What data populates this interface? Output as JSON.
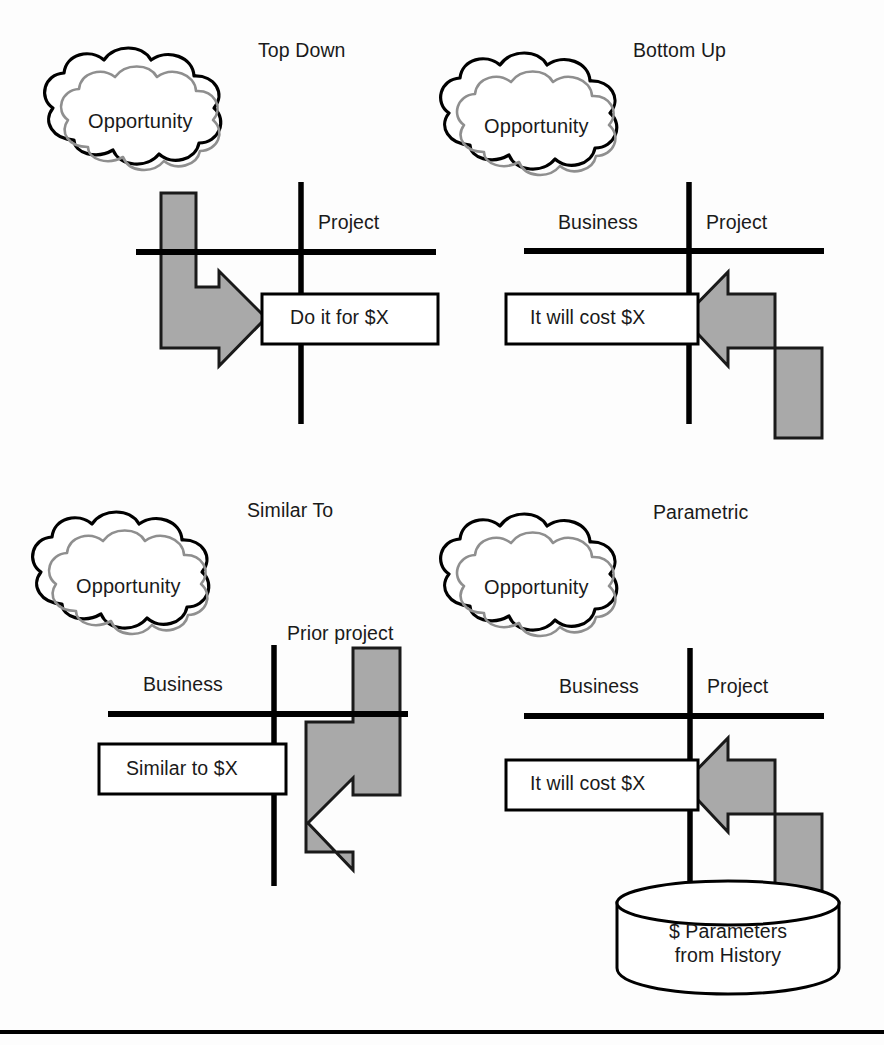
{
  "figure": {
    "bottom_rule": true,
    "colors": {
      "stroke": "#000000",
      "arrow_fill": "#a9a9a9",
      "arrow_stroke": "#1a1a1a",
      "cloud_inner_stroke": "#8c8c8c",
      "background": "#fdfdfd"
    }
  },
  "panels": [
    {
      "id": "top-down",
      "title": "Top Down",
      "cloud_label": "Opportunity",
      "axis_labels": {
        "left": "",
        "right": "Project"
      },
      "box_text": "Do it for $X",
      "arrow": {
        "name": "top-down-arrow",
        "direction": "down-then-right",
        "origin": "cloud",
        "target": "box"
      },
      "cylinder": null
    },
    {
      "id": "bottom-up",
      "title": "Bottom Up",
      "cloud_label": "Opportunity",
      "axis_labels": {
        "left": "Business",
        "right": "Project"
      },
      "box_text": "It will cost $X",
      "arrow": {
        "name": "bottom-up-arrow",
        "direction": "up-then-left",
        "origin": "project-bottom",
        "target": "box"
      },
      "cylinder": null
    },
    {
      "id": "similar-to",
      "title": "Similar To",
      "cloud_label": "Opportunity",
      "axis_labels": {
        "left": "Business",
        "right": "Prior project"
      },
      "box_text": "Similar to $X",
      "arrow": {
        "name": "similar-to-arrow",
        "direction": "down-then-left",
        "origin": "prior-project",
        "target": "box"
      },
      "cylinder": null
    },
    {
      "id": "parametric",
      "title": "Parametric",
      "cloud_label": "Opportunity",
      "axis_labels": {
        "left": "Business",
        "right": "Project"
      },
      "box_text": "It will cost $X",
      "arrow": {
        "name": "parametric-arrow",
        "direction": "up-then-left",
        "origin": "history-database",
        "target": "box"
      },
      "cylinder": {
        "line1": "$ Parameters",
        "line2": "from History"
      }
    }
  ]
}
